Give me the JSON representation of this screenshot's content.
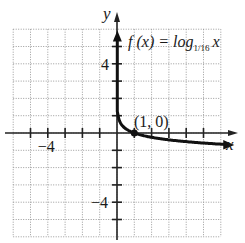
{
  "chart_data": {
    "type": "line",
    "title": "",
    "function_label": {
      "prefix": "f (x) = log",
      "base": "1/16",
      "suffix": "x"
    },
    "xlabel": "x",
    "ylabel": "y",
    "xlim": [
      -6,
      6
    ],
    "ylim": [
      -6,
      6
    ],
    "grid": true,
    "tick_labels": {
      "x": [
        {
          "value": -4,
          "label": "−4"
        }
      ],
      "y": [
        {
          "value": 4,
          "label": "4"
        },
        {
          "value": -4,
          "label": "−4"
        }
      ]
    },
    "annotations": [
      {
        "text": "(1, 0)",
        "x": 1,
        "y": 0
      }
    ],
    "series": [
      {
        "name": "f(x) = log_{1/16} x",
        "x": [
          0.0039,
          0.01,
          0.03,
          0.0625,
          0.125,
          0.25,
          0.5,
          1,
          2,
          4,
          6
        ],
        "values": [
          2,
          1.66,
          1.26,
          1,
          0.75,
          0.5,
          0.25,
          0,
          -0.25,
          -0.5,
          -0.65
        ]
      }
    ],
    "highlighted_points": [
      {
        "x": 1,
        "y": 0
      }
    ],
    "colors": {
      "curve": "#111111",
      "grid": "#9a9a9a",
      "axes": "#222222"
    }
  }
}
